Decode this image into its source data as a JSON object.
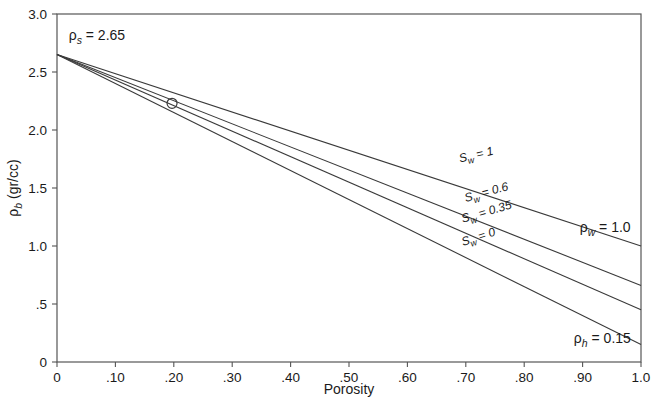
{
  "chart_data": {
    "type": "line",
    "title": "",
    "xlabel": "Porosity",
    "ylabel": "ρb (gr/cc)",
    "xlim": [
      0,
      1.0
    ],
    "ylim": [
      0,
      3.0
    ],
    "grid": false,
    "legend_position": "inline-along-curves",
    "x_ticks": [
      0,
      0.1,
      0.2,
      0.3,
      0.4,
      0.5,
      0.6,
      0.7,
      0.8,
      0.9,
      1.0
    ],
    "x_tick_labels": [
      "0",
      ".10",
      ".20",
      ".30",
      ".40",
      ".50",
      ".60",
      ".70",
      ".80",
      ".90",
      "1.0"
    ],
    "y_ticks": [
      0,
      0.5,
      1.0,
      1.5,
      2.0,
      2.5,
      3.0
    ],
    "y_tick_labels": [
      "0",
      ".5",
      "1.0",
      "1.5",
      "2.0",
      "2.5",
      "3.0"
    ],
    "matrix_density": 2.65,
    "water_density": 1.0,
    "hydrocarbon_density": 0.15,
    "series": [
      {
        "name": "Sw = 1",
        "sw": 1,
        "x": [
          0,
          1.0
        ],
        "values": [
          2.65,
          1.0
        ],
        "label_text": "S",
        "label_sub": "w",
        "label_rest": " = 1",
        "label_x": 0.69,
        "label_y": 1.72,
        "label_rotate": -13.2
      },
      {
        "name": "Sw = 0.6",
        "sw": 0.6,
        "x": [
          0,
          1.0
        ],
        "values": [
          2.65,
          0.66
        ],
        "label_text": "S",
        "label_sub": "w",
        "label_rest": " = 0.6",
        "label_x": 0.7,
        "label_y": 1.38,
        "label_rotate": -15.5
      },
      {
        "name": "Sw = 0.35",
        "sw": 0.35,
        "x": [
          0,
          1.0
        ],
        "values": [
          2.65,
          0.45
        ],
        "label_text": "S",
        "label_sub": "w",
        "label_rest": " = 0.35",
        "label_x": 0.695,
        "label_y": 1.2,
        "label_rotate": -16.5
      },
      {
        "name": "Sw = 0",
        "sw": 0,
        "x": [
          0,
          1.0
        ],
        "values": [
          2.65,
          0.15
        ],
        "label_text": "S",
        "label_sub": "w",
        "label_rest": " = 0",
        "label_x": 0.695,
        "label_y": 1.0,
        "label_rotate": -18.0
      }
    ],
    "markers": [
      {
        "name": "sample-point",
        "x": 0.197,
        "y": 2.23,
        "radius": 5,
        "shape": "open-circle"
      }
    ],
    "annotations": [
      {
        "name": "matrix-density-label",
        "head": "ρ",
        "sub": "s",
        "rest": " = 2.65",
        "x": 0.02,
        "y": 2.78
      },
      {
        "name": "water-density-label",
        "head": "ρ",
        "sub": "w",
        "rest": " = 1.0",
        "x": 0.895,
        "y": 1.12
      },
      {
        "name": "hydrocarbon-density-label",
        "head": "ρ",
        "sub": "h",
        "rest": " = 0.15",
        "x": 0.885,
        "y": 0.16
      }
    ]
  },
  "colors": {
    "line": "#3a3a3a",
    "frame": "#555555",
    "text": "#1a1a1a",
    "background": "#ffffff"
  }
}
